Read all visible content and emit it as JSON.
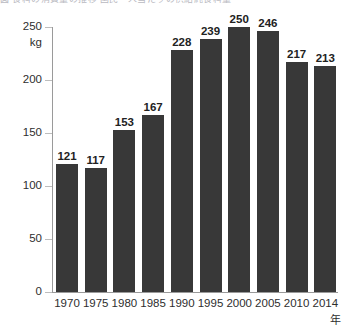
{
  "header": {
    "cropped_text": "図  食料の消費量の推移  国民一人当たりの供給純食料量"
  },
  "chart_data": {
    "type": "bar",
    "title": "",
    "xlabel": "年",
    "ylabel": "kg",
    "categories": [
      "1970",
      "1975",
      "1980",
      "1985",
      "1990",
      "1995",
      "2000",
      "2005",
      "2010",
      "2014"
    ],
    "values": [
      121,
      117,
      153,
      167,
      228,
      239,
      250,
      246,
      217,
      213
    ],
    "value_labels": [
      "121",
      "117",
      "153",
      "167",
      "228",
      "239",
      "250",
      "246",
      "217",
      "213"
    ],
    "ylim": [
      0,
      250
    ],
    "yticks": [
      0,
      50,
      100,
      150,
      200,
      250
    ],
    "ytick_labels": [
      "0",
      "50",
      "100",
      "150",
      "200",
      "250"
    ],
    "grid": false,
    "legend": null,
    "bar_color": "#383838",
    "axis_color": "#9a9a9a",
    "background": "#ffffff"
  }
}
